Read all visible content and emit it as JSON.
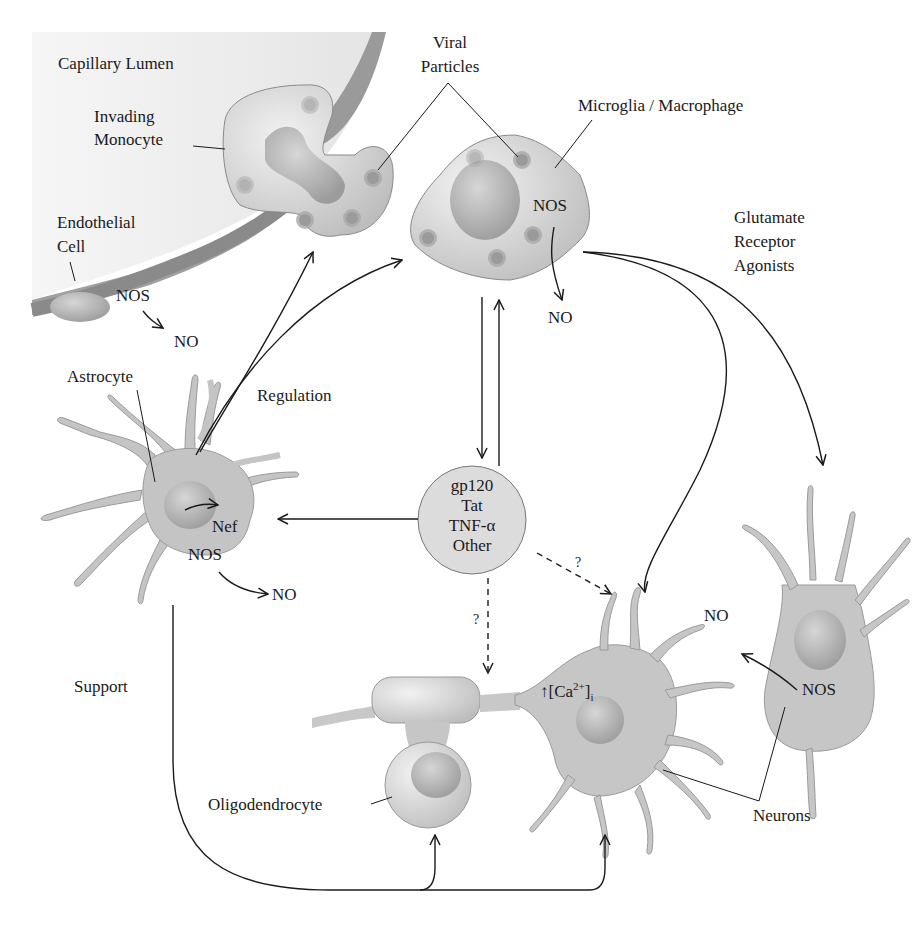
{
  "figure": {
    "labels": {
      "capillary_lumen": "Capillary Lumen",
      "invading_monocyte": [
        "Invading",
        "Monocyte"
      ],
      "viral_particles": [
        "Viral",
        "Particles"
      ],
      "microglia": "Microglia / Macrophage",
      "endothelial_cell": [
        "Endothelial",
        "Cell"
      ],
      "glutamate": [
        "Glutamate",
        "Receptor",
        "Agonists"
      ],
      "astrocyte": "Astrocyte",
      "regulation": "Regulation",
      "support": "Support",
      "oligodendrocyte": "Oligodendrocyte",
      "neurons": "Neurons",
      "nef": "Nef",
      "nos": "NOS",
      "no": "NO",
      "question": "?",
      "calcium": {
        "arrow": "↑",
        "open": "[Ca",
        "sup": "2+",
        "close": "]",
        "sub": "i"
      }
    },
    "central_factors": [
      "gp120",
      "Tat",
      "TNF-α",
      "Other"
    ]
  },
  "colors": {
    "cell_fill": "#c9c9c9",
    "cell_light": "#e6e6e6",
    "nucleus": "#a9a9a9",
    "vessel_wall": "#9a9a9a",
    "lumen": "#eeeeee",
    "line": "#1a1a1a"
  }
}
